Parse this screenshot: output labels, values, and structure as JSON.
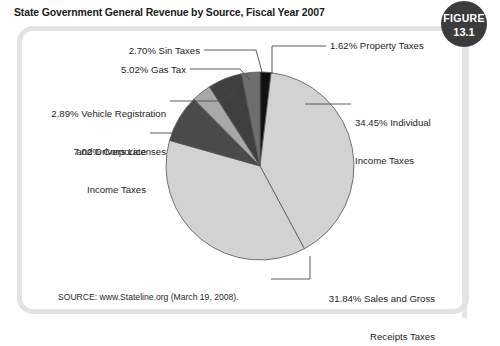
{
  "figure": {
    "title": "State Government General Revenue by Source, Fiscal Year 2007",
    "badge_word": "FIGURE",
    "badge_number": "13.1",
    "source_note": "SOURCE: www.Stateline.org (March 19, 2008)."
  },
  "labels": {
    "sin": "2.70% Sin Taxes",
    "gas": "5.02% Gas Tax",
    "vehicle_line1": "2.89% Vehicle Registration",
    "vehicle_line2": "and Drivers Licenses",
    "corporate_line1": "7.02% Corporate",
    "corporate_line2": "Income Taxes",
    "property": "1.62% Property Taxes",
    "individual_line1": "34.45% Individual",
    "individual_line2": "Income Taxes",
    "sales_line1": "31.84% Sales and Gross",
    "sales_line2": "Receipts Taxes"
  },
  "colors": {
    "property": "#111111",
    "individual": "#d2d2d2",
    "sales": "#d2d2d2",
    "corporate": "#4a4a4a",
    "vehicle": "#a8a8a8",
    "gas": "#3f3f3f",
    "sin": "#6e6e6e",
    "frame": "#e2e2e2",
    "badge": "#3b3b3b",
    "outline": "#555555",
    "leader": "#4a4a4a"
  },
  "chart_data": {
    "type": "pie",
    "title": "State Government General Revenue by Source, Fiscal Year 2007",
    "unit": "percent",
    "start_angle_deg": 0,
    "direction": "clockwise",
    "legend": "none (direct labels with leader lines)",
    "categories": [
      "Property Taxes",
      "Individual Income Taxes",
      "Sales and Gross Receipts Taxes",
      "Corporate Income Taxes",
      "Vehicle Registration and Drivers Licenses",
      "Gas Tax",
      "Sin Taxes"
    ],
    "values": [
      1.62,
      34.45,
      31.84,
      7.02,
      2.89,
      5.02,
      2.7
    ],
    "slices": [
      {
        "label": "Property Taxes",
        "value": 1.62,
        "color": "#111111"
      },
      {
        "label": "Individual Income Taxes",
        "value": 34.45,
        "color": "#d2d2d2"
      },
      {
        "label": "Sales and Gross Receipts Taxes",
        "value": 31.84,
        "color": "#d2d2d2"
      },
      {
        "label": "Corporate Income Taxes",
        "value": 7.02,
        "color": "#4a4a4a"
      },
      {
        "label": "Vehicle Registration and Drivers Licenses",
        "value": 2.89,
        "color": "#a8a8a8"
      },
      {
        "label": "Gas Tax",
        "value": 5.02,
        "color": "#3f3f3f"
      },
      {
        "label": "Sin Taxes",
        "value": 2.7,
        "color": "#6e6e6e"
      }
    ],
    "total": 85.54,
    "source": "www.Stateline.org (March 19, 2008)."
  }
}
